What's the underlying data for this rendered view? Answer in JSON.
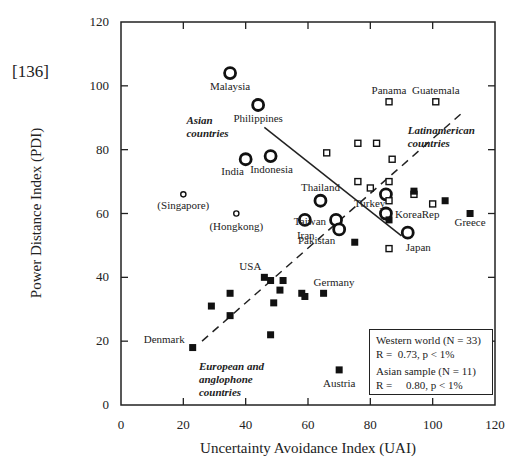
{
  "figure": {
    "reference": "[136]",
    "xlabel": "Uncertainty Avoidance Index (UAI)",
    "ylabel": "Power Distance Index (PDI)"
  },
  "legend": {
    "western_title": "Western world (N = 33)",
    "western_stats": "R =  0.73, p < 1%",
    "asian_title": "Asian sample (N = 11)",
    "asian_stats": "R =     0.80, p < 1%"
  },
  "chart_data": {
    "type": "scatter",
    "title": "",
    "xlabel": "Uncertainty Avoidance Index (UAI)",
    "ylabel": "Power Distance Index (PDI)",
    "xlim": [
      0,
      120
    ],
    "ylim": [
      0,
      120
    ],
    "xticks": [
      0,
      20,
      40,
      60,
      80,
      100,
      120
    ],
    "yticks": [
      0,
      20,
      40,
      60,
      80,
      100,
      120
    ],
    "grid": false,
    "legend_position": "lower right",
    "group_labels": [
      {
        "text": "Asian\ncountries",
        "x": 21,
        "y": 88
      },
      {
        "text": "Latinamerican\ncountries",
        "x": 92,
        "y": 85
      },
      {
        "text": "European and\nanglophone\ncountries",
        "x": 25,
        "y": 11
      }
    ],
    "series": [
      {
        "name": "Asian countries",
        "marker": "open-circle-large",
        "points": [
          {
            "label": "Malaysia",
            "x": 35,
            "y": 104
          },
          {
            "label": "Philippines",
            "x": 44,
            "y": 94
          },
          {
            "label": "India",
            "x": 40,
            "y": 77
          },
          {
            "label": "Indonesia",
            "x": 48,
            "y": 78
          },
          {
            "label": "Thailand",
            "x": 64,
            "y": 64
          },
          {
            "label": "Iran",
            "x": 59,
            "y": 58
          },
          {
            "label": "Taiwan",
            "x": 69,
            "y": 58
          },
          {
            "label": "Pakistan",
            "x": 70,
            "y": 55
          },
          {
            "label": "Turkey",
            "x": 85,
            "y": 66
          },
          {
            "label": "KoreaRep",
            "x": 85,
            "y": 60
          },
          {
            "label": "Japan",
            "x": 92,
            "y": 54
          }
        ]
      },
      {
        "name": "Asian (excluded)",
        "marker": "open-circle-small",
        "points": [
          {
            "label": "(Singapore)",
            "x": 20,
            "y": 66
          },
          {
            "label": "(Hongkong)",
            "x": 37,
            "y": 60
          }
        ]
      },
      {
        "name": "Latinamerican countries",
        "marker": "open-square",
        "points": [
          {
            "label": "Panama",
            "x": 86,
            "y": 95
          },
          {
            "label": "Guatemala",
            "x": 101,
            "y": 95
          },
          {
            "label": "",
            "x": 66,
            "y": 79
          },
          {
            "label": "",
            "x": 76,
            "y": 82
          },
          {
            "label": "",
            "x": 82,
            "y": 82
          },
          {
            "label": "",
            "x": 87,
            "y": 77
          },
          {
            "label": "",
            "x": 76,
            "y": 70
          },
          {
            "label": "",
            "x": 80,
            "y": 68
          },
          {
            "label": "",
            "x": 86,
            "y": 70
          },
          {
            "label": "",
            "x": 86,
            "y": 64
          },
          {
            "label": "",
            "x": 100,
            "y": 63
          },
          {
            "label": "",
            "x": 86,
            "y": 49
          },
          {
            "label": "",
            "x": 94,
            "y": 66
          }
        ]
      },
      {
        "name": "European and anglophone countries",
        "marker": "filled-square",
        "points": [
          {
            "label": "Greece",
            "x": 112,
            "y": 60
          },
          {
            "label": "",
            "x": 104,
            "y": 64
          },
          {
            "label": "",
            "x": 94,
            "y": 67
          },
          {
            "label": "",
            "x": 86,
            "y": 58
          },
          {
            "label": "",
            "x": 75,
            "y": 51
          },
          {
            "label": "Denmark",
            "x": 23,
            "y": 18
          },
          {
            "label": "",
            "x": 29,
            "y": 31
          },
          {
            "label": "",
            "x": 35,
            "y": 35
          },
          {
            "label": "",
            "x": 35,
            "y": 28
          },
          {
            "label": "USA",
            "x": 46,
            "y": 40
          },
          {
            "label": "",
            "x": 48,
            "y": 39
          },
          {
            "label": "",
            "x": 51,
            "y": 36
          },
          {
            "label": "",
            "x": 52,
            "y": 39
          },
          {
            "label": "",
            "x": 49,
            "y": 32
          },
          {
            "label": "",
            "x": 48,
            "y": 22
          },
          {
            "label": "",
            "x": 58,
            "y": 35
          },
          {
            "label": "",
            "x": 59,
            "y": 34
          },
          {
            "label": "Germany",
            "x": 65,
            "y": 35
          },
          {
            "label": "Austria",
            "x": 70,
            "y": 11
          }
        ]
      }
    ],
    "regression_lines": [
      {
        "name": "Western world",
        "style": "dashed",
        "from": [
          26,
          20
        ],
        "to": [
          110,
          92
        ],
        "R": 0.73,
        "N": 33,
        "p": "< 1%"
      },
      {
        "name": "Asian sample",
        "style": "solid",
        "from": [
          46,
          87
        ],
        "to": [
          90,
          53
        ],
        "R": 0.8,
        "N": 11,
        "p": "< 1%"
      }
    ]
  }
}
